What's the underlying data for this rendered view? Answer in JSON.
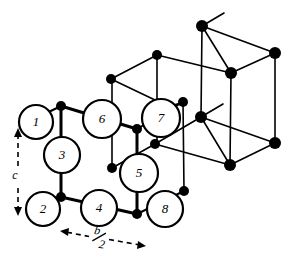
{
  "figure": {
    "background_color": "#ffffff",
    "line_color": "#000000",
    "node_fill": "#000000",
    "circle_fill": "#ffffff"
  },
  "atoms": [
    {
      "id": "atom-1",
      "label": "1",
      "cx": 36,
      "cy": 122,
      "r": 17
    },
    {
      "id": "atom-2",
      "label": "2",
      "cx": 43,
      "cy": 209,
      "r": 17
    },
    {
      "id": "atom-3",
      "label": "3",
      "cx": 62,
      "cy": 155,
      "r": 18
    },
    {
      "id": "atom-4",
      "label": "4",
      "cx": 99,
      "cy": 208,
      "r": 18
    },
    {
      "id": "atom-5",
      "label": "5",
      "cx": 139,
      "cy": 173,
      "r": 19
    },
    {
      "id": "atom-6",
      "label": "6",
      "cx": 102,
      "cy": 119,
      "r": 19
    },
    {
      "id": "atom-7",
      "label": "7",
      "cx": 161,
      "cy": 118,
      "r": 19
    },
    {
      "id": "atom-8",
      "label": "8",
      "cx": 165,
      "cy": 209,
      "r": 18
    }
  ],
  "nodes": [
    {
      "id": "n-front-top-left",
      "cx": 61,
      "cy": 106,
      "r": 5
    },
    {
      "id": "n-front-bottom-left",
      "cx": 61,
      "cy": 197,
      "r": 5
    },
    {
      "id": "n-front-mid",
      "cx": 137,
      "cy": 129,
      "r": 5
    },
    {
      "id": "n-front-bottom-mid",
      "cx": 137,
      "cy": 214,
      "r": 5
    },
    {
      "id": "n-left-back-upper",
      "cx": 111,
      "cy": 79,
      "r": 5
    },
    {
      "id": "n-top-apex",
      "cx": 157,
      "cy": 55,
      "r": 5
    },
    {
      "id": "n-inner-lower-left",
      "cx": 112,
      "cy": 168,
      "r": 5
    },
    {
      "id": "n-inner-mid",
      "cx": 155,
      "cy": 144,
      "r": 5
    },
    {
      "id": "n-right-upper",
      "cx": 183,
      "cy": 102,
      "r": 5
    },
    {
      "id": "n-right-lower",
      "cx": 184,
      "cy": 191,
      "r": 5
    },
    {
      "id": "n-back-top-left",
      "cx": 202,
      "cy": 26,
      "r": 6
    },
    {
      "id": "n-back-top-right",
      "cx": 275,
      "cy": 53,
      "r": 6
    },
    {
      "id": "n-back-top-mid",
      "cx": 231,
      "cy": 73,
      "r": 6
    },
    {
      "id": "n-back-bot-left",
      "cx": 201,
      "cy": 117,
      "r": 6
    },
    {
      "id": "n-back-bot-right",
      "cx": 275,
      "cy": 143,
      "r": 6
    },
    {
      "id": "n-back-bot-mid",
      "cx": 230,
      "cy": 165,
      "r": 6
    }
  ],
  "bonds": [
    {
      "id": "b-1",
      "x1": 61,
      "y1": 106,
      "x2": 61,
      "y2": 197,
      "w": 3
    },
    {
      "id": "b-2",
      "x1": 61,
      "y1": 106,
      "x2": 137,
      "y2": 129,
      "w": 3
    },
    {
      "id": "b-3",
      "x1": 61,
      "y1": 197,
      "x2": 137,
      "y2": 214,
      "w": 3
    },
    {
      "id": "b-4",
      "x1": 137,
      "y1": 129,
      "x2": 137,
      "y2": 214,
      "w": 3
    },
    {
      "id": "b-5",
      "x1": 20,
      "y1": 126,
      "x2": 61,
      "y2": 106,
      "w": 2
    },
    {
      "id": "b-6",
      "x1": 27,
      "y1": 213,
      "x2": 61,
      "y2": 197,
      "w": 2
    },
    {
      "id": "b-7",
      "x1": 137,
      "y1": 129,
      "x2": 183,
      "y2": 102,
      "w": 2
    },
    {
      "id": "b-8",
      "x1": 137,
      "y1": 214,
      "x2": 184,
      "y2": 191,
      "w": 2
    },
    {
      "id": "b-9",
      "x1": 112,
      "y1": 168,
      "x2": 155,
      "y2": 144,
      "w": 1.6
    },
    {
      "id": "b-10",
      "x1": 155,
      "y1": 144,
      "x2": 230,
      "y2": 165,
      "w": 1.6
    },
    {
      "id": "b-11",
      "x1": 112,
      "y1": 168,
      "x2": 112,
      "y2": 79,
      "w": 1.6
    },
    {
      "id": "b-12",
      "x1": 111,
      "y1": 79,
      "x2": 157,
      "y2": 55,
      "w": 1.6
    },
    {
      "id": "b-13",
      "x1": 111,
      "y1": 79,
      "x2": 155,
      "y2": 100,
      "w": 1.6
    },
    {
      "id": "b-14",
      "x1": 157,
      "y1": 55,
      "x2": 231,
      "y2": 73,
      "w": 1.6
    },
    {
      "id": "b-15",
      "x1": 157,
      "y1": 55,
      "x2": 157,
      "y2": 144,
      "w": 1.6
    },
    {
      "id": "b-16",
      "x1": 183,
      "y1": 102,
      "x2": 184,
      "y2": 191,
      "w": 1.6
    },
    {
      "id": "b-17",
      "x1": 202,
      "y1": 26,
      "x2": 275,
      "y2": 53,
      "w": 1.6
    },
    {
      "id": "b-18",
      "x1": 202,
      "y1": 26,
      "x2": 231,
      "y2": 73,
      "w": 1.6
    },
    {
      "id": "b-19",
      "x1": 275,
      "y1": 53,
      "x2": 231,
      "y2": 73,
      "w": 1.6
    },
    {
      "id": "b-20",
      "x1": 202,
      "y1": 26,
      "x2": 201,
      "y2": 117,
      "w": 1.6
    },
    {
      "id": "b-21",
      "x1": 275,
      "y1": 53,
      "x2": 275,
      "y2": 143,
      "w": 1.6
    },
    {
      "id": "b-22",
      "x1": 231,
      "y1": 73,
      "x2": 230,
      "y2": 165,
      "w": 1.6
    },
    {
      "id": "b-23",
      "x1": 201,
      "y1": 117,
      "x2": 275,
      "y2": 143,
      "w": 1.6
    },
    {
      "id": "b-24",
      "x1": 201,
      "y1": 117,
      "x2": 230,
      "y2": 165,
      "w": 1.6
    },
    {
      "id": "b-25",
      "x1": 275,
      "y1": 143,
      "x2": 230,
      "y2": 165,
      "w": 1.6
    },
    {
      "id": "b-26",
      "x1": 112,
      "y1": 168,
      "x2": 112,
      "y2": 168,
      "w": 1.6
    },
    {
      "id": "b-27",
      "x1": 155,
      "y1": 144,
      "x2": 196,
      "y2": 120,
      "w": 1.6
    },
    {
      "id": "b-28",
      "x1": 183,
      "y1": 102,
      "x2": 160,
      "y2": 110,
      "w": 1.6
    }
  ],
  "stubs": [
    {
      "id": "stub-top",
      "x1": 202,
      "y1": 26,
      "x2": 224,
      "y2": 13,
      "w": 1.6
    },
    {
      "id": "stub-middle",
      "x1": 201,
      "y1": 117,
      "x2": 223,
      "y2": 104,
      "w": 1.6
    }
  ],
  "axes": {
    "c": {
      "label": "c",
      "x": 18,
      "y_top": 128,
      "y_bottom": 216,
      "label_x": 15,
      "label_y": 176
    },
    "b_half": {
      "label_numerator": "b",
      "label_denominator": "2",
      "label_text": "b/2",
      "x_left": 60,
      "x_right": 146,
      "y_left": 231,
      "y_right": 246,
      "label_x": 99,
      "label_y": 238
    }
  }
}
